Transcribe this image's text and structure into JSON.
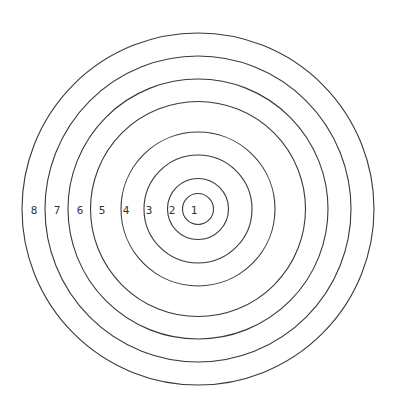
{
  "diagram": {
    "type": "concentric-circles",
    "center": {
      "x": 198,
      "y": 209
    },
    "line_color": "#3a3a3a",
    "label_color": "#333333",
    "background": "#ffffff",
    "rings": [
      {
        "label": "1",
        "radius": 15.5,
        "label_x": 194
      },
      {
        "label": "2",
        "radius": 30.5,
        "label_x": 172
      },
      {
        "label": "3",
        "radius": 54,
        "label_x": 149
      },
      {
        "label": "4",
        "radius": 77,
        "label_x": 126
      },
      {
        "label": "5",
        "radius": 107.5,
        "label_x": 102
      },
      {
        "label": "6",
        "radius": 130,
        "label_x": 80
      },
      {
        "label": "7",
        "radius": 153,
        "label_x": 57
      },
      {
        "label": "8",
        "radius": 176,
        "label_x": 34
      }
    ]
  }
}
